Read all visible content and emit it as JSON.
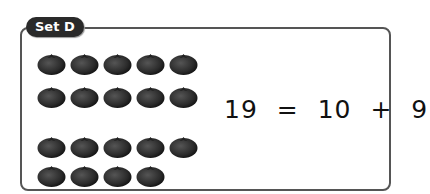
{
  "set_label": "Set D",
  "equation": {
    "total": "19",
    "equals": "=",
    "tens": "10",
    "plus": "+",
    "ones": "9"
  },
  "tomato_groups": [
    {
      "name": "ten-group",
      "count": 10,
      "rows": [
        5,
        5
      ]
    },
    {
      "name": "ones-group",
      "count": 9,
      "rows": [
        5,
        4
      ]
    }
  ],
  "colors": {
    "tomato": "#2b2b2b",
    "border": "#555555",
    "label_bg": "#2a2a2a",
    "label_text": "#ffffff"
  }
}
